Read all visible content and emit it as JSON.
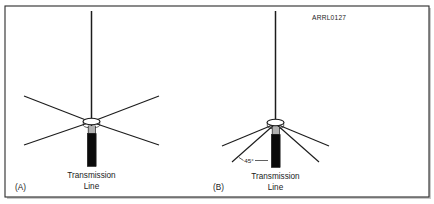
{
  "figure": {
    "credit_label": "ARRL0127",
    "background_color": "#ffffff",
    "border_color": "#2b2b2b",
    "ink_color": "#1c1c1c",
    "coax_color": "#0a0a0a"
  },
  "panel_a": {
    "panel_label": "(A)",
    "caption_line1": "Transmission",
    "caption_line2": "Line",
    "radial_count": 4,
    "radial_orientation": "horizontal",
    "element_name": "quarter-wave-vertical-with-horizontal-radials"
  },
  "panel_b": {
    "panel_label": "(B)",
    "caption_line1": "Transmission",
    "caption_line2": "Line",
    "angle_label": "45°",
    "radial_count": 4,
    "radial_orientation": "drooping",
    "element_name": "quarter-wave-vertical-with-drooping-radials"
  }
}
